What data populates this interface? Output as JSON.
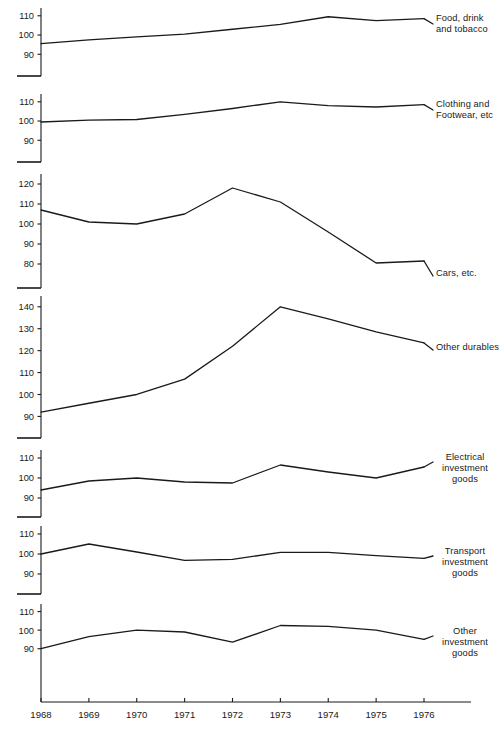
{
  "chart_data": {
    "type": "line",
    "title": "",
    "subtitle": "",
    "xlabel": "",
    "ylabel": "",
    "grid": false,
    "legend_position": "right-inline",
    "x": [
      1968,
      1969,
      1970,
      1971,
      1972,
      1973,
      1974,
      1975,
      1976
    ],
    "xticklabels": [
      "1968",
      "1969",
      "1970",
      "1971",
      "1972",
      "1973",
      "1974",
      "1975",
      "1976"
    ],
    "xlim": [
      1968,
      1976
    ],
    "line_color": "#1a1a1a",
    "line_width": 1.3,
    "panels": [
      {
        "name": "food-drink-tobacco",
        "label": "Food, drink\nand tobacco",
        "label_lines": [
          "Food, drink",
          "and tobacco"
        ],
        "label_align": "left",
        "yticks": [
          110,
          100,
          90
        ],
        "yticklabels": [
          "110",
          "100",
          "90"
        ],
        "ylim": [
          86,
          113
        ],
        "values": [
          95.5,
          97.5,
          99.0,
          100.5,
          103.0,
          105.5,
          109.5,
          107.5,
          108.5
        ]
      },
      {
        "name": "clothing-footwear",
        "label": "Clothing and\nFootwear, etc",
        "label_lines": [
          "Clothing and",
          "Footwear, etc"
        ],
        "label_align": "left",
        "yticks": [
          110,
          100,
          90
        ],
        "yticklabels": [
          "110",
          "100",
          "90"
        ],
        "ylim": [
          86,
          113
        ],
        "values": [
          99.5,
          100.5,
          100.8,
          103.5,
          106.5,
          110.0,
          108.0,
          107.3,
          108.5
        ]
      },
      {
        "name": "cars-etc",
        "label": "Cars, etc.",
        "label_lines": [
          "Cars, etc."
        ],
        "label_align": "left",
        "yticks": [
          120,
          110,
          100,
          90,
          80
        ],
        "yticklabels": [
          "120",
          "110",
          "100",
          "90",
          "80"
        ],
        "ylim": [
          76,
          124
        ],
        "values": [
          107.0,
          101.0,
          100.0,
          105.0,
          118.0,
          111.0,
          96.0,
          80.5,
          81.5
        ]
      },
      {
        "name": "other-durables",
        "label": "Other durables",
        "label_lines": [
          "Other durables"
        ],
        "label_align": "left",
        "yticks": [
          140,
          130,
          120,
          110,
          100,
          90
        ],
        "yticklabels": [
          "140",
          "130",
          "120",
          "110",
          "100",
          "90"
        ],
        "ylim": [
          87,
          144
        ],
        "values": [
          92.0,
          96.0,
          100.0,
          107.0,
          122.0,
          140.0,
          134.5,
          128.5,
          123.5
        ]
      },
      {
        "name": "electrical-investment-goods",
        "label": "Electrical\ninvestment\ngoods",
        "label_lines": [
          "Electrical",
          "investment",
          "goods"
        ],
        "label_align": "center",
        "yticks": [
          110,
          100,
          90
        ],
        "yticklabels": [
          "110",
          "100",
          "90"
        ],
        "ylim": [
          87,
          113
        ],
        "values": [
          94.0,
          98.5,
          100.0,
          98.0,
          97.5,
          106.5,
          103.0,
          100.0,
          105.5
        ]
      },
      {
        "name": "transport-investment-goods",
        "label": "Transport\ninvestment\ngoods",
        "label_lines": [
          "Transport",
          "investment",
          "goods"
        ],
        "label_align": "center",
        "yticks": [
          110,
          100,
          90
        ],
        "yticklabels": [
          "110",
          "100",
          "90"
        ],
        "ylim": [
          87,
          113
        ],
        "values": [
          100.0,
          105.0,
          101.0,
          96.8,
          97.3,
          100.8,
          100.8,
          99.2,
          97.8
        ]
      },
      {
        "name": "other-investment-goods",
        "label": "Other\ninvestment\ngoods",
        "label_lines": [
          "Other",
          "investment",
          "goods"
        ],
        "label_align": "center",
        "yticks": [
          110,
          100,
          90
        ],
        "yticklabels": [
          "110",
          "100",
          "90"
        ],
        "ylim": [
          85,
          113
        ],
        "values": [
          90.0,
          96.5,
          100.0,
          99.0,
          93.5,
          102.5,
          102.0,
          100.0,
          95.0
        ]
      }
    ]
  },
  "labels": {
    "p0_l0": "Food, drink",
    "p0_l1": "and tobacco",
    "p1_l0": "Clothing and",
    "p1_l1": "Footwear, etc",
    "p2_l0": "Cars, etc.",
    "p3_l0": "Other durables",
    "p4_l0": "Electrical",
    "p4_l1": "investment",
    "p4_l2": "goods",
    "p5_l0": "Transport",
    "p5_l1": "investment",
    "p5_l2": "goods",
    "p6_l0": "Other",
    "p6_l1": "investment",
    "p6_l2": "goods"
  }
}
